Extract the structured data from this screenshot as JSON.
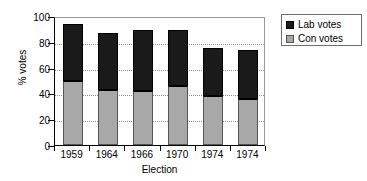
{
  "chart_data": {
    "type": "bar",
    "subtype": "stacked-column",
    "title": "",
    "xlabel": "Election",
    "ylabel": "% votes",
    "categories": [
      "1959",
      "1964",
      "1966",
      "1970",
      "1974",
      "1974"
    ],
    "series": [
      {
        "name": "Con votes",
        "color": "#a8a8a8",
        "values": [
          50,
          43,
          42,
          46,
          38,
          36
        ]
      },
      {
        "name": "Lab votes",
        "color": "#1a1a1a",
        "values": [
          44,
          44,
          47,
          43,
          37,
          38
        ]
      }
    ],
    "stack_order": [
      "Con votes",
      "Lab votes"
    ],
    "totals": [
      94,
      87,
      89,
      89,
      75,
      74
    ],
    "ylim": [
      0,
      100
    ],
    "yticks": [
      0,
      20,
      40,
      60,
      80,
      100
    ],
    "ytick_labels": [
      "0",
      "20",
      "40",
      "60",
      "80",
      "100"
    ],
    "grid": "horizontal-dotted",
    "legend_position": "right",
    "legend_entries": [
      "Lab votes",
      "Con votes"
    ]
  },
  "axes": {
    "y_title": "% votes",
    "x_title": "Election"
  },
  "legend": {
    "items": [
      {
        "label": "Lab votes",
        "swatch": "black-square-icon"
      },
      {
        "label": "Con votes",
        "swatch": "gray-square-icon"
      }
    ]
  }
}
